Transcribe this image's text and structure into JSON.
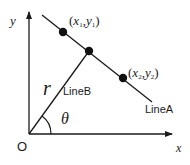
{
  "diagram": {
    "type": "geometry",
    "axes": {
      "x_label": "x",
      "y_label": "y",
      "origin_label": "O"
    },
    "lines": [
      {
        "name": "LineA",
        "label": "LineA"
      },
      {
        "name": "LineB",
        "label": "LineB"
      }
    ],
    "points": [
      {
        "label_x": "x",
        "label_y": "y",
        "sub": "1"
      },
      {
        "label_x": "x",
        "label_y": "y",
        "sub": "2"
      }
    ],
    "symbols": {
      "distance": "r",
      "angle": "θ"
    },
    "colors": {
      "stroke": "#1a1a1a",
      "background": "#ffffff"
    }
  }
}
